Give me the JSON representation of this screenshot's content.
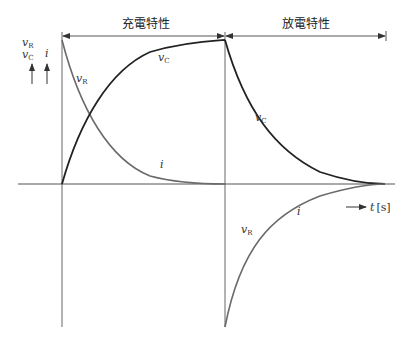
{
  "diagram": {
    "title_charge": "充電特性",
    "title_discharge": "放電特性",
    "y_labels": {
      "vr": "v",
      "vr_sub": "R",
      "vc": "v",
      "vc_sub": "C",
      "i": "i"
    },
    "curve_labels": {
      "charge_vr": "v",
      "charge_vr_sub": "R",
      "charge_vc": "v",
      "charge_vc_sub": "C",
      "charge_i": "i",
      "discharge_vc": "v",
      "discharge_vc_sub": "C",
      "discharge_vr": "v",
      "discharge_vr_sub": "R",
      "discharge_i": "i"
    },
    "x_axis_label": "t",
    "x_axis_unit": "[s]",
    "colors": {
      "vc_curve": "#222222",
      "vr_i_curve": "#6a6a6a",
      "axis": "#555555"
    }
  }
}
